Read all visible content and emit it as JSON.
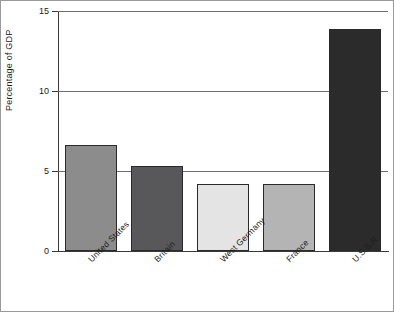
{
  "chart_data": {
    "type": "bar",
    "title": "",
    "subtitle": "",
    "xlabel": "",
    "ylabel": "Percentage of GDP",
    "categories": [
      "United States",
      "Britain",
      "West Germany",
      "France",
      "U.S.S.R."
    ],
    "values": [
      6.6,
      5.3,
      4.2,
      4.2,
      13.9
    ],
    "ylim": [
      0,
      15
    ],
    "yticks": [
      0,
      5,
      10,
      15
    ],
    "ytick_labels": [
      "0",
      "5",
      "10",
      "15"
    ],
    "grid": "horizontal",
    "legend": "none",
    "series": [
      {
        "name": "Military spending as percentage of GDP",
        "values": [
          6.6,
          5.3,
          4.2,
          4.2,
          13.9
        ]
      }
    ],
    "bar_colors": [
      "#8c8c8c",
      "#58585a",
      "#e4e4e4",
      "#b4b4b4",
      "#2b2b2b"
    ],
    "bar_border_color": "#2a2a2a",
    "axis_color": "#3a3a3a",
    "gridline_color": "#6e6e6e",
    "background_color": "#ffffff"
  }
}
